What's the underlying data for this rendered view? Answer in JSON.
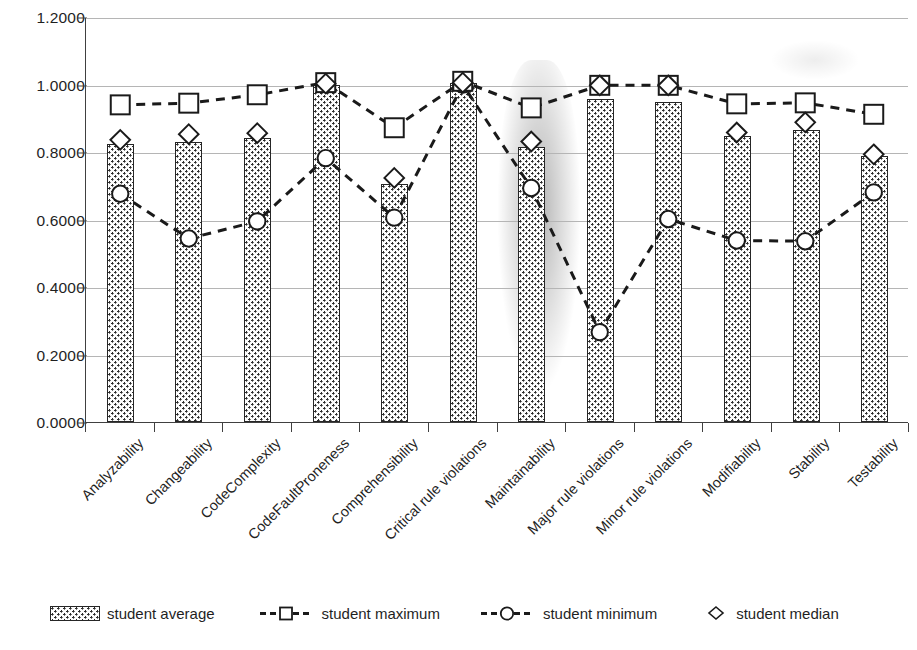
{
  "chart_data": {
    "type": "bar",
    "title": "",
    "xlabel": "",
    "ylabel": "",
    "ylim": [
      0.0,
      1.2
    ],
    "ytick_labels": [
      "0.0000",
      "0.2000",
      "0.4000",
      "0.6000",
      "0.8000",
      "1.0000",
      "1.2000"
    ],
    "ytick_values": [
      0.0,
      0.2,
      0.4,
      0.6,
      0.8,
      1.0,
      1.2
    ],
    "grid": true,
    "legend_position": "bottom",
    "categories": [
      "Analyzability",
      "Changeability",
      "CodeComplexity",
      "CodeFaultProneness",
      "Comprehensibility",
      "Critical rule violations",
      "Maintainability",
      "Major rule violations",
      "Minor rule violations",
      "Modifiability",
      "Stability",
      "Testability"
    ],
    "series": [
      {
        "name": "student average",
        "kind": "bar",
        "marker": "pattern-swatch",
        "values": [
          0.824,
          0.83,
          0.841,
          0.998,
          0.705,
          1.005,
          0.815,
          0.957,
          0.948,
          0.847,
          0.865,
          0.789
        ]
      },
      {
        "name": "student maximum",
        "kind": "line",
        "marker": "square",
        "line": "dashed",
        "values": [
          0.942,
          0.947,
          0.972,
          1.008,
          0.874,
          1.012,
          0.933,
          1.0,
          1.0,
          0.945,
          0.948,
          0.914
        ]
      },
      {
        "name": "student minimum",
        "kind": "line",
        "marker": "circle",
        "line": "dashed",
        "values": [
          0.678,
          0.545,
          0.596,
          0.784,
          0.607,
          1.002,
          0.695,
          0.267,
          0.603,
          0.539,
          0.537,
          0.682
        ]
      },
      {
        "name": "student median",
        "kind": "scatter",
        "marker": "diamond",
        "values": [
          0.838,
          0.855,
          0.858,
          1.005,
          0.725,
          1.008,
          0.833,
          1.0,
          1.0,
          0.86,
          0.89,
          0.795
        ]
      }
    ]
  },
  "legend": {
    "items": [
      {
        "label": "student average",
        "marker": "pattern-swatch"
      },
      {
        "label": "student maximum",
        "marker": "dashed-square"
      },
      {
        "label": "student minimum",
        "marker": "dashed-circle"
      },
      {
        "label": "student median",
        "marker": "diamond"
      }
    ]
  },
  "colors": {
    "axis": "#404040",
    "grid": "#b5b5b5",
    "marker_stroke": "#1a1a1a",
    "marker_fill": "#ffffff",
    "bar_border": "#262626",
    "bar_fill": "#fdfdfd",
    "text": "#1f1f1f"
  }
}
